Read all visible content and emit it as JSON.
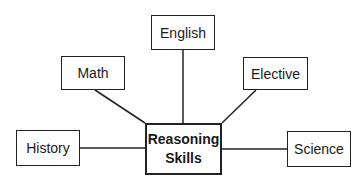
{
  "diagram": {
    "type": "hub-and-spoke",
    "center": {
      "line1": "Reasoning",
      "line2": "Skills"
    },
    "nodes": [
      {
        "id": "english",
        "label": "English"
      },
      {
        "id": "math",
        "label": "Math"
      },
      {
        "id": "elective",
        "label": "Elective"
      },
      {
        "id": "history",
        "label": "History"
      },
      {
        "id": "science",
        "label": "Science"
      }
    ],
    "edges": [
      {
        "from": "center",
        "to": "english"
      },
      {
        "from": "center",
        "to": "math"
      },
      {
        "from": "center",
        "to": "elective"
      },
      {
        "from": "center",
        "to": "history"
      },
      {
        "from": "center",
        "to": "science"
      }
    ],
    "colors": {
      "stroke": "#222222",
      "background": "#ffffff",
      "text": "#1a1a1a"
    }
  }
}
